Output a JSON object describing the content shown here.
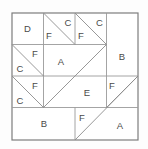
{
  "figure": {
    "background_color": "#fdfdfd",
    "fill_color": "#ffffff",
    "line_color": "#8c8c8c",
    "frame_color": "#7d7d7d",
    "label_color": "#4a4a4a",
    "frame": {
      "x": 12,
      "y": 13,
      "width": 126,
      "height": 127
    },
    "grid_units": 4,
    "unit": 31.5
  },
  "labels": [
    {
      "id": "label-d-top-left",
      "text": "D",
      "x": 27.5,
      "y": 29
    },
    {
      "id": "label-f-top-row-1",
      "text": "F",
      "x": 49,
      "y": 36
    },
    {
      "id": "label-c-top-row-1",
      "text": "C",
      "x": 68,
      "y": 23
    },
    {
      "id": "label-f-top-row-2",
      "text": "F",
      "x": 81,
      "y": 36
    },
    {
      "id": "label-c-top-row-2",
      "text": "C",
      "x": 99.5,
      "y": 23
    },
    {
      "id": "label-b-right",
      "text": "B",
      "x": 122,
      "y": 57
    },
    {
      "id": "label-f-left-upper",
      "text": "F",
      "x": 35,
      "y": 54
    },
    {
      "id": "label-c-left-upper",
      "text": "C",
      "x": 20,
      "y": 69
    },
    {
      "id": "label-a-center",
      "text": "A",
      "x": 61,
      "y": 62
    },
    {
      "id": "label-f-left-lower",
      "text": "F",
      "x": 35,
      "y": 86
    },
    {
      "id": "label-c-left-lower",
      "text": "C",
      "x": 20,
      "y": 101
    },
    {
      "id": "label-e-center-right",
      "text": "E",
      "x": 87,
      "y": 93
    },
    {
      "id": "label-f-right-lower",
      "text": "F",
      "x": 112,
      "y": 86
    },
    {
      "id": "label-b-bottom",
      "text": "B",
      "x": 44,
      "y": 124
    },
    {
      "id": "label-f-bottom",
      "text": "F",
      "x": 82,
      "y": 118
    },
    {
      "id": "label-a-bottom-right",
      "text": "A",
      "x": 120,
      "y": 126
    }
  ],
  "grid_lines": [
    {
      "id": "grid-h-row1",
      "x1": 12,
      "y1": 44.5,
      "x2": 106.5,
      "y2": 44.5
    },
    {
      "id": "grid-h-row2",
      "x1": 12,
      "y1": 76,
      "x2": 138,
      "y2": 76
    },
    {
      "id": "grid-h-row3",
      "x1": 12,
      "y1": 107.5,
      "x2": 138,
      "y2": 107.5
    },
    {
      "id": "grid-v-col1",
      "x1": 43.5,
      "y1": 13,
      "x2": 43.5,
      "y2": 107.5
    },
    {
      "id": "grid-v-col2",
      "x1": 75,
      "y1": 13,
      "x2": 75,
      "y2": 44.5
    },
    {
      "id": "grid-v-col2b",
      "x1": 75,
      "y1": 107.5,
      "x2": 75,
      "y2": 140
    },
    {
      "id": "grid-v-col3",
      "x1": 106.5,
      "y1": 13,
      "x2": 106.5,
      "y2": 107.5
    }
  ],
  "cut_lines": [
    {
      "id": "cut-top-tri-1",
      "x1": 43.5,
      "y1": 13,
      "x2": 75,
      "y2": 44.5
    },
    {
      "id": "cut-top-tri-2",
      "x1": 75,
      "y1": 13,
      "x2": 106.5,
      "y2": 44.5
    },
    {
      "id": "cut-left-tri-upper",
      "x1": 12,
      "y1": 44.5,
      "x2": 43.5,
      "y2": 76
    },
    {
      "id": "cut-left-tri-lower",
      "x1": 12,
      "y1": 76,
      "x2": 43.5,
      "y2": 107.5
    },
    {
      "id": "cut-center-diag",
      "x1": 43.5,
      "y1": 107.5,
      "x2": 106.5,
      "y2": 44.5
    },
    {
      "id": "cut-right-f-diag",
      "x1": 106.5,
      "y1": 107.5,
      "x2": 138,
      "y2": 76
    },
    {
      "id": "cut-bottom-diag",
      "x1": 75,
      "y1": 140,
      "x2": 138,
      "y2": 76
    }
  ]
}
